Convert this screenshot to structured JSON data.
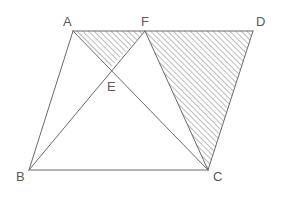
{
  "figure": {
    "background_color": "#ffffff",
    "stroke_color": "#6a6a6a",
    "hatch_color": "#7d7d7d",
    "label_color": "#5a5a5a",
    "stroke_width": 1,
    "hatch_spacing_px": 4,
    "hatch_angle_deg": 45,
    "width": 282,
    "height": 198
  },
  "points": {
    "A": {
      "label": "A",
      "x": 73,
      "y": 31,
      "label_x": 63,
      "label_y": 26
    },
    "F": {
      "label": "F",
      "x": 145,
      "y": 31,
      "label_x": 141,
      "label_y": 26
    },
    "D": {
      "label": "D",
      "x": 253,
      "y": 31,
      "label_x": 256,
      "label_y": 26
    },
    "B": {
      "label": "B",
      "x": 29,
      "y": 170,
      "label_x": 16,
      "label_y": 181
    },
    "C": {
      "label": "C",
      "x": 208,
      "y": 170,
      "label_x": 213,
      "label_y": 181
    },
    "E": {
      "label": "E",
      "x": 110,
      "y": 68,
      "label_x": 107,
      "label_y": 91
    }
  },
  "segments": [
    {
      "name": "segment-A-D",
      "from": "A",
      "to": "D"
    },
    {
      "name": "segment-A-B",
      "from": "A",
      "to": "B"
    },
    {
      "name": "segment-B-C",
      "from": "B",
      "to": "C"
    },
    {
      "name": "segment-C-D",
      "from": "C",
      "to": "D"
    },
    {
      "name": "segment-A-C",
      "from": "A",
      "to": "C"
    },
    {
      "name": "segment-B-F",
      "from": "B",
      "to": "F"
    },
    {
      "name": "segment-F-C",
      "from": "F",
      "to": "C"
    }
  ],
  "shaded_regions": [
    {
      "name": "hatched-triangle-A-F-E",
      "vertices": [
        "A",
        "F",
        "E"
      ]
    },
    {
      "name": "hatched-triangle-F-D-C",
      "vertices": [
        "F",
        "D",
        "C"
      ]
    }
  ],
  "labels_list": [
    "A",
    "F",
    "D",
    "B",
    "C",
    "E"
  ]
}
